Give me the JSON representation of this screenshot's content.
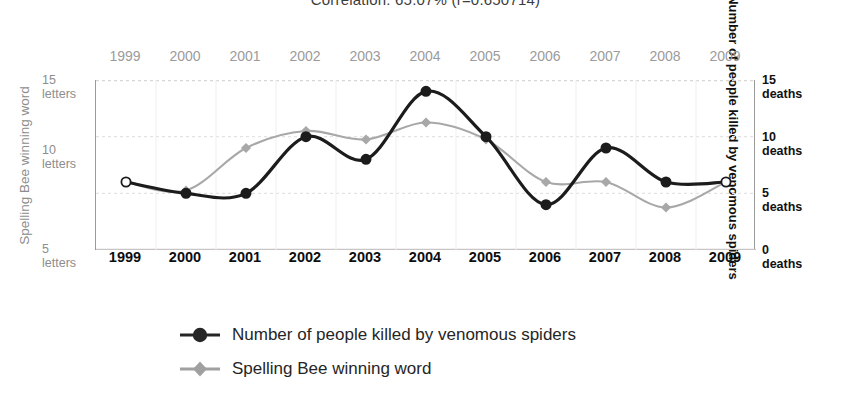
{
  "title": "Correlation: 65.07% (r=0.650714)",
  "left_axis": {
    "title": "Spelling Bee winning word",
    "ticks": [
      {
        "value": 15,
        "num": "15",
        "unit": "letters"
      },
      {
        "value": 10,
        "num": "10",
        "unit": "letters"
      },
      {
        "value": 5,
        "num": "5",
        "unit": "letters"
      }
    ]
  },
  "right_axis": {
    "title": "Number of people killed by venomous spiders",
    "ticks": [
      {
        "value": 15,
        "num": "15",
        "unit": "deaths"
      },
      {
        "value": 10,
        "num": "10",
        "unit": "deaths"
      },
      {
        "value": 5,
        "num": "5",
        "unit": "deaths"
      },
      {
        "value": 0,
        "num": "0",
        "unit": "deaths"
      }
    ]
  },
  "years_top": [
    "1999",
    "2000",
    "2001",
    "2002",
    "2003",
    "2004",
    "2005",
    "2006",
    "2007",
    "2008",
    "2009"
  ],
  "years_bottom": [
    "1999",
    "2000",
    "2001",
    "2002",
    "2003",
    "2004",
    "2005",
    "2006",
    "2007",
    "2008",
    "2009"
  ],
  "legend": [
    {
      "label": "Number of people killed by venomous spiders",
      "marker": "circle",
      "color": "#262626"
    },
    {
      "label": "Spelling Bee winning word",
      "marker": "diamond",
      "color": "#a0a0a0"
    }
  ],
  "colors": {
    "spiders_line": "#1c1c1c",
    "spelling_line": "#a8a8a8",
    "grid": "#e6e2e2",
    "axis": "#9a9a9a",
    "year_top_text": "#9b9b9b",
    "year_bottom_text": "#0d0d0d",
    "left_axis_text": "#8d8d8d",
    "right_axis_text": "#111111"
  },
  "chart_data": {
    "type": "line",
    "title": "Correlation: 65.07% (r=0.650714)",
    "x": [
      1999,
      2000,
      2001,
      2002,
      2003,
      2004,
      2005,
      2006,
      2007,
      2008,
      2009
    ],
    "xlabel": "",
    "grid": true,
    "legend_position": "bottom-left",
    "series": [
      {
        "name": "Number of people killed by venomous spiders",
        "marker": "circle",
        "color": "#1c1c1c",
        "axis": "right",
        "ylabel": "Number of people killed by venomous spiders",
        "yunit": "deaths",
        "ylim": [
          0,
          15
        ],
        "yticks": [
          0,
          5,
          10,
          15
        ],
        "values": [
          6,
          5,
          5,
          10,
          8,
          14,
          10,
          4,
          9,
          6,
          6
        ]
      },
      {
        "name": "Spelling Bee winning word",
        "marker": "diamond",
        "color": "#a8a8a8",
        "axis": "left",
        "ylabel": "Spelling Bee winning word",
        "yunit": "letters",
        "ylim": [
          5,
          15
        ],
        "yticks": [
          5,
          10,
          15
        ],
        "values": [
          9,
          8.5,
          11,
          12,
          11.5,
          12.5,
          11.5,
          9,
          9,
          7.5,
          9
        ]
      }
    ]
  }
}
